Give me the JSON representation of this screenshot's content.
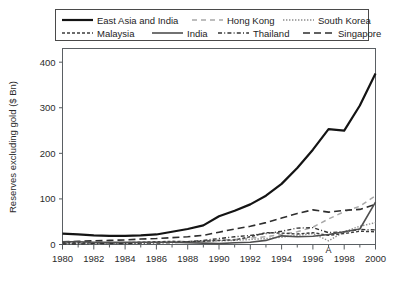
{
  "chart_data": {
    "type": "line",
    "title": "",
    "xlabel": "",
    "ylabel": "Reserves excluding gold ($ Bn)",
    "xlim": [
      1980,
      2000
    ],
    "ylim": [
      0,
      430
    ],
    "yticks": [
      0,
      100,
      200,
      300,
      400
    ],
    "xticks": [
      1980,
      1982,
      1984,
      1986,
      1988,
      1990,
      1992,
      1994,
      1996,
      1998,
      2000
    ],
    "xtick_labels": [
      "1980",
      "1982",
      "1984",
      "1986",
      "1988",
      "1990",
      "1992",
      "1994",
      "1996",
      "1998",
      "2000"
    ],
    "ytick_labels": [
      "0",
      "100",
      "200",
      "300",
      "400"
    ],
    "grid": false,
    "legend_position": "top",
    "x": [
      1980,
      1981,
      1982,
      1983,
      1984,
      1985,
      1986,
      1987,
      1988,
      1989,
      1990,
      1991,
      1992,
      1993,
      1994,
      1995,
      1996,
      1997,
      1998,
      1999,
      2000
    ],
    "series": [
      {
        "name": "East Asia and India",
        "style": "solid-thick",
        "color": "#141414",
        "values": [
          24,
          22,
          20,
          19,
          19,
          20,
          22,
          28,
          34,
          42,
          62,
          74,
          88,
          107,
          133,
          168,
          208,
          253,
          250,
          305,
          375
        ]
      },
      {
        "name": "Hong Kong",
        "style": "dashed-light",
        "color": "#a8a8a8",
        "values": [
          2,
          2,
          2,
          3,
          3,
          4,
          5,
          6,
          7,
          8,
          9,
          11,
          14,
          17,
          22,
          28,
          38,
          56,
          72,
          84,
          107
        ]
      },
      {
        "name": "South Korea",
        "style": "dotted-fine",
        "color": "#8c8c8c",
        "values": [
          3,
          3,
          3,
          3,
          3,
          3,
          4,
          5,
          6,
          7,
          8,
          9,
          11,
          13,
          16,
          20,
          24,
          8,
          28,
          40,
          48
        ]
      },
      {
        "name": "Malaysia",
        "style": "dash-dot-short",
        "color": "#3d3d3d",
        "values": [
          4,
          4,
          4,
          4,
          4,
          5,
          6,
          7,
          6,
          7,
          9,
          10,
          17,
          26,
          25,
          23,
          26,
          20,
          24,
          29,
          28
        ]
      },
      {
        "name": "India",
        "style": "solid-medium",
        "color": "#4f4f4f",
        "values": [
          6,
          6,
          5,
          5,
          5,
          5,
          5,
          5,
          4,
          3,
          2,
          4,
          5,
          9,
          19,
          17,
          18,
          22,
          28,
          34,
          93
        ]
      },
      {
        "name": "Thailand",
        "style": "dash-dot",
        "color": "#333333",
        "values": [
          1,
          1,
          2,
          2,
          2,
          3,
          3,
          4,
          6,
          9,
          13,
          17,
          20,
          24,
          29,
          36,
          37,
          26,
          28,
          33,
          32
        ]
      },
      {
        "name": "Singapore",
        "style": "long-dash",
        "color": "#2e2e2e",
        "values": [
          6,
          7,
          8,
          9,
          10,
          12,
          13,
          15,
          17,
          20,
          27,
          34,
          40,
          48,
          58,
          68,
          76,
          71,
          75,
          77,
          88
        ]
      }
    ],
    "annotations": [
      {
        "text": "A",
        "x": 1997,
        "y": 4
      }
    ]
  },
  "legend": {
    "items": [
      {
        "label": "East Asia and India",
        "style": "solid-thick"
      },
      {
        "label": "Hong Kong",
        "style": "dashed-light"
      },
      {
        "label": "South Korea",
        "style": "dotted-fine"
      },
      {
        "label": "Malaysia",
        "style": "dash-dot-short"
      },
      {
        "label": "India",
        "style": "solid-medium"
      },
      {
        "label": "Thailand",
        "style": "dash-dot"
      },
      {
        "label": "Singapore",
        "style": "long-dash"
      }
    ]
  }
}
